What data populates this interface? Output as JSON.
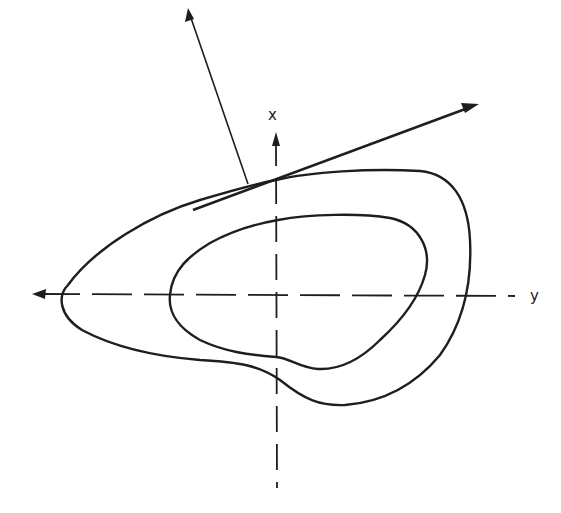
{
  "diagram": {
    "type": "phase-plane contour sketch",
    "axes": {
      "vertical": {
        "label": "x",
        "direction": "up"
      },
      "horizontal": {
        "label": "y",
        "direction": "left-arrowhead, label on right"
      },
      "style": "dashed",
      "origin_px": [
        276,
        295
      ]
    },
    "curves": [
      {
        "name": "outer-closed-curve",
        "role": "outer level curve"
      },
      {
        "name": "inner-closed-curve",
        "role": "inner level curve"
      }
    ],
    "vectors": [
      {
        "name": "tangent-vector",
        "role": "tangent to outer curve",
        "from_px": [
          193,
          210
        ],
        "to_px": [
          478,
          104
        ]
      },
      {
        "name": "normal-vector",
        "role": "normal to outer curve",
        "from_px": [
          248,
          183
        ],
        "to_px": [
          188,
          10
        ]
      }
    ],
    "colors": {
      "ink": "#1e1e1e",
      "background": "#ffffff"
    }
  },
  "labels": {
    "x_axis": "x",
    "y_axis": "y"
  }
}
